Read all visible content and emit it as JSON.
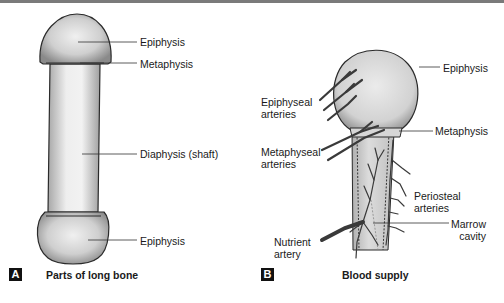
{
  "panel_a": {
    "badge": "A",
    "caption": "Parts of long bone",
    "labels": {
      "epiphysis_top": "Epiphysis",
      "metaphysis": "Metaphysis",
      "diaphysis": "Diaphysis (shaft)",
      "epiphysis_bottom": "Epiphysis"
    }
  },
  "panel_b": {
    "badge": "B",
    "caption": "Blood supply",
    "labels": {
      "epiphysis": "Epiphysis",
      "epiphyseal_arteries_1": "Epiphyseal",
      "epiphyseal_arteries_2": "arteries",
      "metaphysis": "Metaphysis",
      "metaphyseal_arteries_1": "Metaphyseal",
      "metaphyseal_arteries_2": "arteries",
      "periosteal_arteries_1": "Periosteal",
      "periosteal_arteries_2": "arteries",
      "marrow_cavity_1": "Marrow",
      "marrow_cavity_2": "cavity",
      "nutrient_artery_1": "Nutrient",
      "nutrient_artery_2": "artery"
    }
  },
  "colors": {
    "bone_light": "#e6e6e6",
    "bone_dark": "#8c8c8c",
    "outline": "#2a2a2a",
    "artery": "#3a3a3a",
    "topbar": "#7a7a7a"
  }
}
